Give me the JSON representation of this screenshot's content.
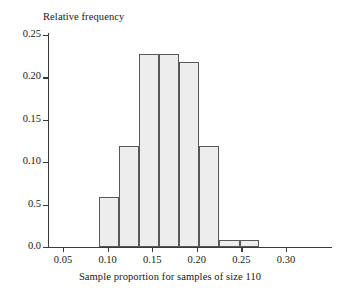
{
  "chart_data": {
    "type": "bar",
    "title": "",
    "xlabel": "Sample proportion for samples of size 110",
    "ylabel": "Relative frequency",
    "xlim": [
      0.035,
      0.285
    ],
    "ylim": [
      0.0,
      0.25
    ],
    "grid": false,
    "legend": null,
    "xticks": [
      "0.05",
      "0.10",
      "0.15",
      "0.20",
      "0.25",
      "0.30"
    ],
    "xtick_values": [
      0.05,
      0.1,
      0.15,
      0.2,
      0.25,
      0.3
    ],
    "yticks": [
      "0.00",
      "0.5",
      "0.10",
      "0.15",
      "0.20",
      "0.25"
    ],
    "ytick_values": [
      0.0,
      0.05,
      0.1,
      0.15,
      0.2,
      0.25
    ],
    "ytick_note": "Axis label printed as 0.5 in the source figure at the 0.05 position",
    "bin_width": 0.0225,
    "categories": [
      "0.090-0.113",
      "0.113-0.135",
      "0.135-0.158",
      "0.158-0.180",
      "0.180-0.203",
      "0.203-0.225",
      "0.225-0.248",
      "0.248-0.270"
    ],
    "bin_edges": [
      0.09,
      0.113,
      0.135,
      0.158,
      0.18,
      0.203,
      0.225,
      0.248,
      0.27
    ],
    "values": [
      0.059,
      0.119,
      0.228,
      0.228,
      0.218,
      0.119,
      0.008,
      0.008
    ]
  },
  "axes": {
    "y_title": "Relative frequency",
    "x_title": "Sample proportion for samples of size 110",
    "y_labels": [
      {
        "text": "0.25",
        "value": 0.25
      },
      {
        "text": "0.20",
        "value": 0.2
      },
      {
        "text": "0.15",
        "value": 0.15
      },
      {
        "text": "0.10",
        "value": 0.1
      },
      {
        "text": "0.5",
        "value": 0.05
      },
      {
        "text": "0.0",
        "value": 0.0
      }
    ],
    "x_labels": [
      {
        "text": "0.05",
        "value": 0.05
      },
      {
        "text": "0.10",
        "value": 0.1
      },
      {
        "text": "0.15",
        "value": 0.15
      },
      {
        "text": "0.20",
        "value": 0.2
      },
      {
        "text": "0.25",
        "value": 0.25
      },
      {
        "text": "0.30",
        "value": 0.3
      }
    ]
  },
  "style": {
    "bar_fill": "#ededed",
    "bar_stroke": "#585858",
    "axis_color": "#3a3a3a",
    "text_color": "#171717",
    "background": "#ffffff"
  }
}
